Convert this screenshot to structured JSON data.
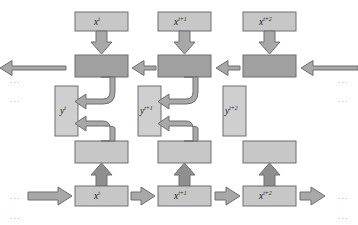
{
  "diagram": {
    "type": "bidirectional-recurrent-network-unfolded",
    "background": "#ffffff",
    "colors": {
      "box_light": "#c7c7c7",
      "box_dark": "#a0a0a0",
      "box_y": "#cfcfcf",
      "box_stroke": "#6e6e6e",
      "arrow_fill": "#a8a8a8",
      "arrow_stroke": "#6e6e6e",
      "arrow_dark_fill": "#8f8f8f",
      "text": "#1a1a1a",
      "dots": "#8a8a8a"
    },
    "columns": [
      {
        "index": 0,
        "input_top": {
          "base": "x",
          "sup": "t"
        },
        "output": {
          "base": "y",
          "sup": "t"
        },
        "input_bottom": {
          "base": "x",
          "sup": "t"
        },
        "has_curved_connectors": true
      },
      {
        "index": 1,
        "input_top": {
          "base": "x",
          "sup": "t+1"
        },
        "output": {
          "base": "y",
          "sup": "t+1"
        },
        "input_bottom": {
          "base": "x",
          "sup": "t+1"
        },
        "has_curved_connectors": true
      },
      {
        "index": 2,
        "input_top": {
          "base": "x",
          "sup": "t+2"
        },
        "output": {
          "base": "y",
          "sup": "t+2"
        },
        "input_bottom": {
          "base": "x",
          "sup": "t+2"
        },
        "has_curved_connectors": false
      }
    ],
    "ellipses": {
      "glyph": "• • •",
      "left_upper": "...",
      "left_lower": "...",
      "right_upper": "...",
      "right_lower": "...",
      "bottom_left_upper": "...",
      "bottom_left_lower": "...",
      "bottom_right_upper": "...",
      "bottom_right_lower": "..."
    },
    "flows": {
      "backward_direction": "right-to-left",
      "forward_direction": "left-to-right",
      "top_input_direction": "downward",
      "bottom_input_direction": "upward"
    },
    "top_artifact": "  "
  }
}
